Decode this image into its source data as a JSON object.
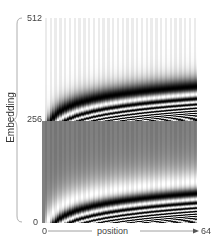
{
  "chart_data": {
    "type": "heatmap",
    "title": "",
    "xlabel": "position",
    "ylabel": "Embedding",
    "x_ticks": [
      "0",
      "64"
    ],
    "y_ticks": [
      "0",
      "256",
      "512"
    ],
    "xlim": [
      0,
      64
    ],
    "ylim": [
      0,
      512
    ],
    "grid": false,
    "legend": "none",
    "colormap": "grayscale",
    "halves": [
      {
        "name": "lower",
        "range": [
          0,
          256
        ],
        "function": "sin"
      },
      {
        "name": "upper",
        "range": [
          256,
          512
        ],
        "function": "cos"
      }
    ],
    "positions": 64,
    "dims_per_half": 256
  },
  "axes": {
    "y_label": "Embedding",
    "x_label": "position",
    "y_tick_top": "512",
    "y_tick_mid": "256",
    "y_tick_bottom": "0",
    "x_tick_left": "0",
    "x_tick_right": "64"
  },
  "colors": {
    "axis_line": "#888888",
    "text": "#444444"
  }
}
